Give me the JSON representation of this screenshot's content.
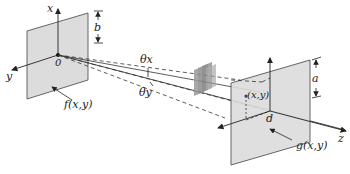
{
  "diagram": {
    "type": "optical-geometry",
    "colors": {
      "plane_fill": "#dcdcdc",
      "plane_stroke": "#555555",
      "line": "#333333",
      "object": "#8a8a8a"
    },
    "input_plane": {
      "label": "f(x,y)",
      "origin_label": "0",
      "axis_x_label": "x",
      "axis_y_label": "y",
      "dimension_label": "b"
    },
    "output_plane": {
      "label": "g(x,y)",
      "center_label": "d",
      "point_label": "(x,y)",
      "axis_z_label": "z",
      "dimension_label": "a"
    },
    "angles": {
      "theta_x": "θx",
      "theta_y": "θy"
    },
    "object": {
      "name": "hologram-stack"
    },
    "caption": ""
  }
}
